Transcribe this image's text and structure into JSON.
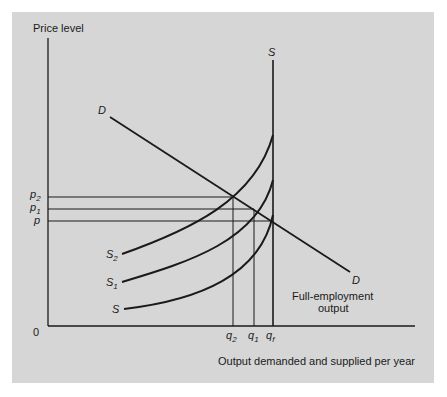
{
  "diagram": {
    "y_axis_label": "Price level",
    "x_axis_label": "Output demanded and supplied per year",
    "origin_label": "0",
    "demand": {
      "label_start": "D",
      "label_end": "D"
    },
    "supply_curves": [
      {
        "label": "S",
        "sub": "2"
      },
      {
        "label": "S",
        "sub": "1"
      },
      {
        "label": "S",
        "sub": ""
      }
    ],
    "vertical_supply_label": "S",
    "price_ticks": [
      {
        "label": "p",
        "sub": "2"
      },
      {
        "label": "p",
        "sub": "1"
      },
      {
        "label": "p",
        "sub": ""
      }
    ],
    "quantity_ticks": [
      {
        "label": "q",
        "sub": "2"
      },
      {
        "label": "q",
        "sub": "1"
      },
      {
        "label": "q",
        "sub": "f"
      }
    ],
    "annotation_line1": "Full-employment",
    "annotation_line2": "output",
    "colors": {
      "background": "#d6d6d6",
      "ink": "#1a1a1a"
    }
  }
}
